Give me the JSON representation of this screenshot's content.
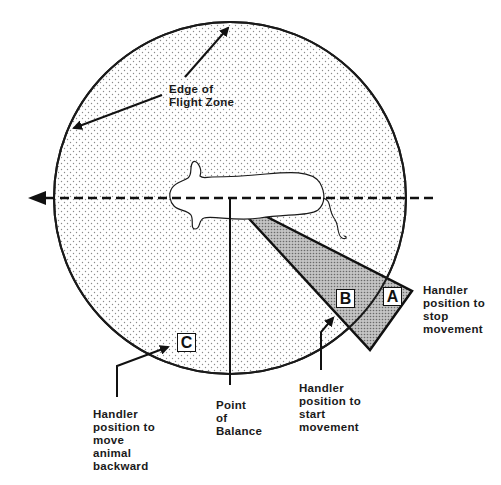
{
  "diagram": {
    "labels": {
      "edge_of_flight_zone": "Edge of\nFlight Zone",
      "point_of_balance": "Point\nof\nBalance",
      "handler_stop": "Handler\nposition to\nstop\nmovement",
      "handler_start": "Handler\nposition to\nstart\nmovement",
      "handler_backward": "Handler\nposition to\nmove\nanimal\nbackward"
    },
    "markers": {
      "a": "A",
      "b": "B",
      "c": "C"
    },
    "colors": {
      "stroke": "#1a1a1a",
      "zone_dots": "#9a9a9a",
      "wedge_fill": "#b8b8b8",
      "background": "#ffffff"
    }
  }
}
